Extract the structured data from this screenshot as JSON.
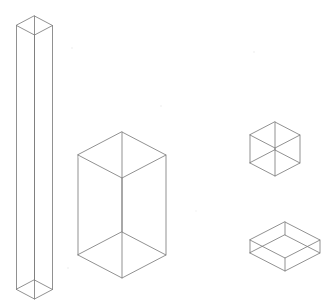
{
  "canvas": {
    "width": 331,
    "height": 306,
    "background_color": "#ffffff",
    "line_color": "#7d7d7d",
    "speck_color": "#f2f2f2",
    "title": "Isometric Wireframe Boxes",
    "description": "Four transparent wireframe rectangular boxes drawn in isometric projection on a plain white background."
  },
  "shapes": [
    {
      "name": "tall-column",
      "label": "Tall slender column",
      "projection": "isometric",
      "top_center": {
        "x": 34.5,
        "y": 16.0
      },
      "half_width": 18.0,
      "half_depth": 9.5,
      "height": 264.0
    },
    {
      "name": "medium-box",
      "label": "Medium upright box",
      "projection": "isometric",
      "top_center": {
        "x": 122.0,
        "y": 132.0
      },
      "half_width": 44.0,
      "half_depth": 23.0,
      "height": 100.0
    },
    {
      "name": "small-cube",
      "label": "Small cube",
      "projection": "isometric",
      "top_center": {
        "x": 275.0,
        "y": 122.0
      },
      "half_width": 25.0,
      "half_depth": 13.0,
      "height": 28.0
    },
    {
      "name": "flat-slab",
      "label": "Flat elongated slab",
      "projection": "isometric",
      "top_center": {
        "x": 285.0,
        "y": 222.0
      },
      "half_width": 35.0,
      "half_depth": 18.0,
      "height": 13.0
    }
  ],
  "specks": [
    {
      "name": "speck-upper-left",
      "x": 72,
      "y": 48,
      "r": 0.9
    },
    {
      "name": "speck-upper-center",
      "x": 161,
      "y": 106,
      "r": 0.9
    },
    {
      "name": "speck-upper-right",
      "x": 254,
      "y": 52,
      "r": 0.9
    },
    {
      "name": "speck-lower-left",
      "x": 68,
      "y": 268,
      "r": 0.9
    },
    {
      "name": "speck-mid-left",
      "x": 79,
      "y": 157,
      "r": 0.8
    },
    {
      "name": "speck-mid-right",
      "x": 196,
      "y": 211,
      "r": 0.8
    }
  ]
}
